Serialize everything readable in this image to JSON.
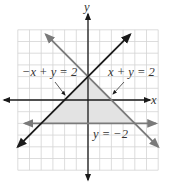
{
  "figure": {
    "title": "",
    "axes": {
      "x_label": "x",
      "y_label": "y",
      "x_range": [
        -6,
        6
      ],
      "y_range": [
        -6,
        6
      ],
      "grid": true,
      "tick_labels": false
    },
    "labels": {
      "line_neg_x_plus_y": "−x + y = 2",
      "line_x_plus_y": "x + y = 2",
      "line_y_eq": "y = −2"
    },
    "lines": [
      {
        "id": "neg_x_plus_y",
        "equation": "-x + y = 2",
        "slope": 1,
        "intercept": 2,
        "color": "#1a1a1a"
      },
      {
        "id": "x_plus_y",
        "equation": "x + y = 2",
        "slope": -1,
        "intercept": 2,
        "color": "#7a7a7a"
      },
      {
        "id": "y_eq_neg2",
        "equation": "y = -2",
        "slope": 0,
        "intercept": -2,
        "color": "#7a7a7a"
      }
    ],
    "shaded_region": {
      "vertices": [
        [
          0,
          2
        ],
        [
          -4,
          -2
        ],
        [
          4,
          -2
        ]
      ],
      "fill": "#e3e3e3"
    },
    "colors": {
      "grid": "#d4d4d4",
      "axis": "#1a1a1a",
      "shade": "#e3e3e3"
    }
  }
}
